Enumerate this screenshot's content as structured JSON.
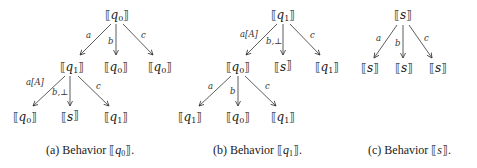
{
  "figures": [
    {
      "id": "a",
      "caption": {
        "prefix": "(a) Behavior ",
        "state": "q",
        "sub": "0",
        "suffix": "."
      },
      "root": {
        "label": "q",
        "sub": "0"
      },
      "edges_level1": [
        "a",
        "b",
        "c"
      ],
      "level1": [
        {
          "label": "q",
          "sub": "1"
        },
        {
          "label": "q",
          "sub": "0"
        },
        {
          "label": "q",
          "sub": "0"
        }
      ],
      "edges_level2": [
        "a[A]",
        "b,⊥",
        "c"
      ],
      "level2": [
        {
          "label": "q",
          "sub": "0"
        },
        {
          "label": "s",
          "sub": ""
        },
        {
          "label": "q",
          "sub": "1"
        }
      ]
    },
    {
      "id": "b",
      "caption": {
        "prefix": "(b) Behavior ",
        "state": "q",
        "sub": "1",
        "suffix": "."
      },
      "root": {
        "label": "q",
        "sub": "1"
      },
      "edges_level1": [
        "a[A]",
        "b,⊥",
        "c"
      ],
      "level1": [
        {
          "label": "q",
          "sub": "0"
        },
        {
          "label": "s",
          "sub": ""
        },
        {
          "label": "q",
          "sub": "1"
        }
      ],
      "edges_level2": [
        "a",
        "b",
        "c"
      ],
      "level2": [
        {
          "label": "q",
          "sub": "1"
        },
        {
          "label": "q",
          "sub": "0"
        },
        {
          "label": "q",
          "sub": "1"
        }
      ]
    },
    {
      "id": "c",
      "caption": {
        "prefix": "(c) Behavior ",
        "state": "s",
        "sub": "",
        "suffix": "."
      },
      "root": {
        "label": "s",
        "sub": ""
      },
      "edges_level1": [
        "a",
        "b",
        "c"
      ],
      "level1": [
        {
          "label": "s",
          "sub": ""
        },
        {
          "label": "s",
          "sub": ""
        },
        {
          "label": "s",
          "sub": ""
        }
      ]
    }
  ],
  "brackets": {
    "open": "⟦",
    "close": "⟧"
  }
}
